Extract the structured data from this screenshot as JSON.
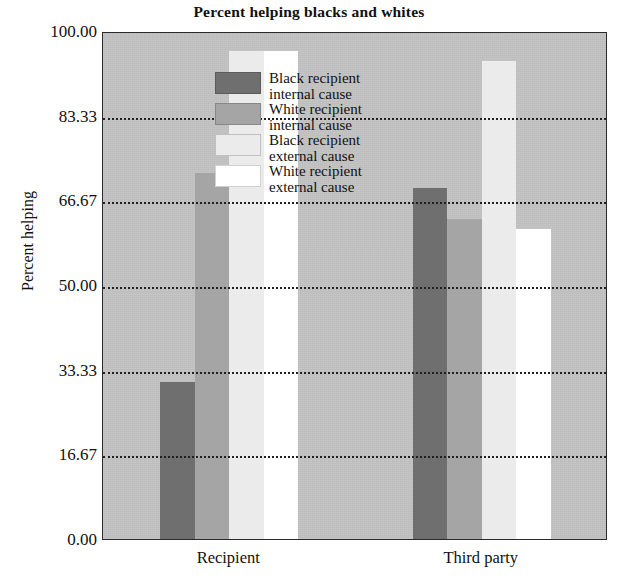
{
  "chart_data": {
    "type": "bar",
    "title": "Percent helping blacks and whites",
    "xlabel": "",
    "ylabel": "Percent helping",
    "categories": [
      "Recipient",
      "Third party"
    ],
    "ylim": [
      0,
      100
    ],
    "yticks": [
      "0.00",
      "16.67",
      "33.33",
      "50.00",
      "66.67",
      "83.33",
      "100.00"
    ],
    "ytick_values": [
      0,
      16.67,
      33.33,
      50,
      66.67,
      83.33,
      100
    ],
    "grid": true,
    "legend_position": "top-left inside plot",
    "series": [
      {
        "name": "Black recipient\ninternal cause",
        "color": "#6f6f6f",
        "values": [
          31.0,
          69.0
        ]
      },
      {
        "name": "White recipient\ninternal cause",
        "color": "#a5a5a5",
        "values": [
          72.0,
          63.0
        ]
      },
      {
        "name": "Black recipient\nexternal cause",
        "color": "#ebebeb",
        "values": [
          96.0,
          94.0
        ]
      },
      {
        "name": "White recipient\nexternal cause",
        "color": "#ffffff",
        "values": [
          96.0,
          61.0
        ]
      }
    ]
  },
  "colors": {
    "plot_background": "#c3c3c3",
    "axis": "#2b2b2b",
    "gridline": "#202020",
    "page_background": "#ffffff",
    "text": "#111111"
  }
}
